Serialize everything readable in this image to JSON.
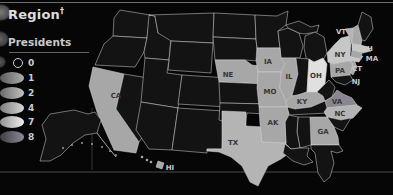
{
  "title": {
    "text": "Region",
    "dagger": "†"
  },
  "legend": {
    "heading": "Presidents",
    "items": [
      {
        "value": "0",
        "type": "ring"
      },
      {
        "value": "1",
        "type": "fill",
        "color_from": "#5a5a5a",
        "color_to": "#aeaeae"
      },
      {
        "value": "2",
        "type": "fill",
        "color_from": "#696969",
        "color_to": "#c2c2c2"
      },
      {
        "value": "4",
        "type": "fill",
        "color_from": "#7d7d7d",
        "color_to": "#d6d6d6"
      },
      {
        "value": "7",
        "type": "fill",
        "color_from": "#929292",
        "color_to": "#eeeeee"
      },
      {
        "value": "8",
        "type": "fill",
        "color_from": "#3d3d44",
        "color_to": "#8e8996"
      }
    ]
  },
  "map": {
    "color_scale": {
      "0": "#131313",
      "1": "#a7a7a7",
      "2": "#b4b4b4",
      "4": "#c7c7c7",
      "7": "#e0e0e0",
      "8": "#8b8591"
    },
    "border_color": "#d8d8d8",
    "background": "#060606",
    "labeled_states": {
      "california": {
        "label": "CA",
        "presidents": 1
      },
      "nebraska": {
        "label": "NE",
        "presidents": 1
      },
      "iowa": {
        "label": "IA",
        "presidents": 1
      },
      "missouri": {
        "label": "MO",
        "presidents": 1
      },
      "illinois": {
        "label": "IL",
        "presidents": 1
      },
      "ohio": {
        "label": "OH",
        "presidents": 7
      },
      "kentucky": {
        "label": "KY",
        "presidents": 1
      },
      "arkansas": {
        "label": "AK",
        "presidents": 1
      },
      "texas": {
        "label": "TX",
        "presidents": 2
      },
      "hawaii": {
        "label": "HI",
        "presidents": 1
      },
      "georgia": {
        "label": "GA",
        "presidents": 1
      },
      "north-carolina": {
        "label": "NC",
        "presidents": 2
      },
      "virginia": {
        "label": "VA",
        "presidents": 8
      },
      "pennsylvania": {
        "label": "PA",
        "presidents": 1
      },
      "new-york": {
        "label": "NY",
        "presidents": 4
      },
      "vermont": {
        "label": "VT",
        "presidents": 2
      },
      "new-hampshire": {
        "label": "NH",
        "presidents": 1
      },
      "massachusetts": {
        "label": "MA",
        "presidents": 4
      },
      "connecticut": {
        "label": "CT",
        "presidents": 1
      },
      "new-jersey": {
        "label": "NJ",
        "presidents": 1
      }
    }
  }
}
